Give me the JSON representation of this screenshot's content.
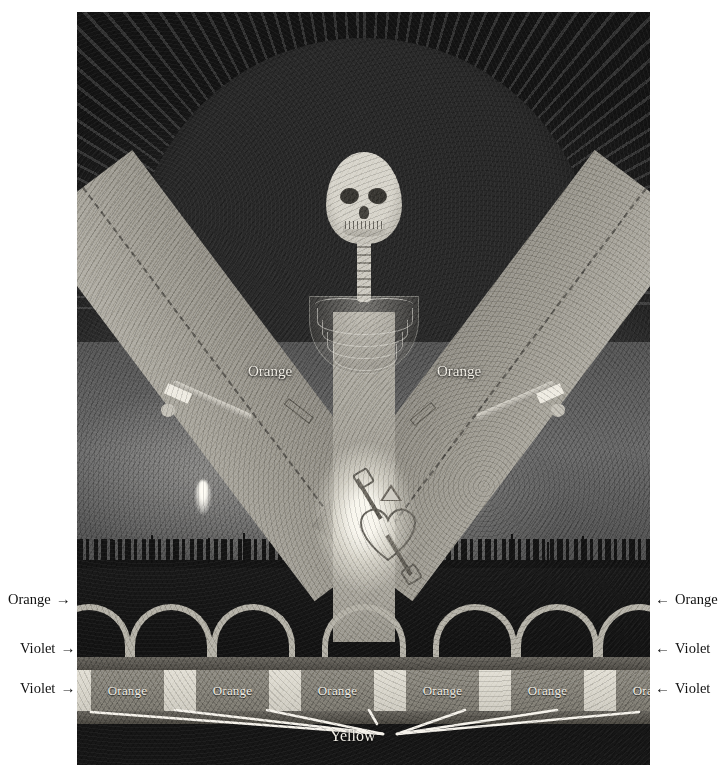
{
  "plate": {
    "title": "Annotated color-key illustration",
    "figure_caption": ""
  },
  "band_labels": {
    "left": "Orange",
    "right": "Orange"
  },
  "strip_band": {
    "orange_label": "Orange",
    "segments": [
      {
        "kind": "yellow",
        "label": "",
        "width": 14
      },
      {
        "kind": "orange",
        "label": "Orange",
        "width": 73
      },
      {
        "kind": "yellow",
        "label": "",
        "width": 32
      },
      {
        "kind": "orange",
        "label": "Orange",
        "width": 73
      },
      {
        "kind": "yellow",
        "label": "",
        "width": 32
      },
      {
        "kind": "orange",
        "label": "Orange",
        "width": 73
      },
      {
        "kind": "yellow",
        "label": "",
        "width": 32
      },
      {
        "kind": "orange",
        "label": "Orange",
        "width": 73
      },
      {
        "kind": "yellow",
        "label": "",
        "width": 32
      },
      {
        "kind": "orange",
        "label": "Orange",
        "width": 73
      },
      {
        "kind": "yellow",
        "label": "",
        "width": 32
      },
      {
        "kind": "orange",
        "label": "Orange",
        "width": 73
      },
      {
        "kind": "yellow",
        "label": "",
        "width": 14
      }
    ]
  },
  "yellow_callout": {
    "label": "Yellow",
    "arrow_count": 7
  },
  "annotations_left": [
    {
      "label": "Orange",
      "arrow": "→",
      "target": "arcade-arches"
    },
    {
      "label": "Violet",
      "arrow": "→",
      "target": "violet-band-upper"
    },
    {
      "label": "Violet",
      "arrow": "→",
      "target": "violet-band-lower"
    }
  ],
  "annotations_right": [
    {
      "label": "Orange",
      "arrow": "←",
      "target": "arcade-arches"
    },
    {
      "label": "Violet",
      "arrow": "←",
      "target": "violet-band-upper"
    },
    {
      "label": "Violet",
      "arrow": "←",
      "target": "violet-band-lower"
    }
  ],
  "scene": {
    "subject": "skeleton-figure",
    "elements": [
      "halo-arc",
      "radiating-rays",
      "skull",
      "spine",
      "ribcage",
      "v-shaped-bands",
      "glowing-heart-emblem",
      "triangle-emblem",
      "crossed-keys",
      "city-skyline",
      "arcade-of-arches",
      "striped-base-band"
    ],
    "arch_count": 7
  },
  "colors": {
    "page_background": "#ffffff",
    "plate_dark": "#141414",
    "band_gray": "#a5a29a",
    "halo_white": "#f4f1ea",
    "yellow_strip": "#e3e0d6",
    "violet_band": "#5a5750",
    "label_text_dark": "#111111",
    "label_text_light": "#f3f0e8"
  }
}
